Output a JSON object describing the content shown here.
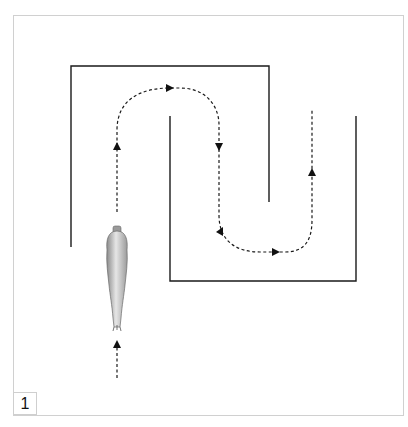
{
  "figure": {
    "label": "1",
    "frame_color": "#d0d0d0",
    "wall_color": "#1a1a1a",
    "path_color": "#1a1a1a",
    "horse_color": "#bdbdbd",
    "walls": [
      {
        "name": "outer-left-wall",
        "points": [
          [
            71,
            247
          ],
          [
            71,
            66
          ],
          [
            269,
            66
          ],
          [
            269,
            202
          ]
        ]
      },
      {
        "name": "inner-u-wall",
        "points": [
          [
            170,
            116
          ],
          [
            170,
            281
          ],
          [
            356,
            281
          ],
          [
            356,
            116
          ]
        ]
      }
    ],
    "path": {
      "style": "dashed",
      "direction_arrows": [
        "up",
        "right",
        "down",
        "left-down",
        "right",
        "up"
      ]
    },
    "entry_arrow": {
      "direction": "up"
    },
    "rider_figure": "horse-top-view"
  }
}
